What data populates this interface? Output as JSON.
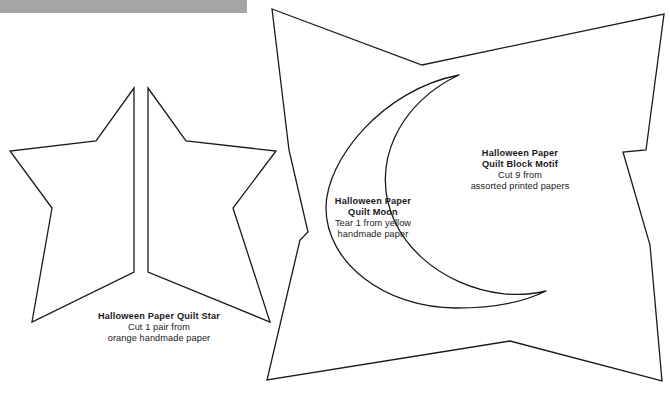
{
  "page": {
    "background_color": "#ffffff",
    "ink_color": "#1a1a1a",
    "scan_bar_color": "#a5a5a5",
    "width": 670,
    "height": 394
  },
  "templates": [
    {
      "id": "star",
      "shape": "five-pointed-star-split-in-half",
      "title": "Halloween Paper Quilt Star",
      "line1": "Cut 1 pair from",
      "line2": "orange handmade paper"
    },
    {
      "id": "moon",
      "shape": "crescent-moon",
      "title_line1": "Halloween Paper",
      "title_line2": "Quilt Moon",
      "line1": "Tear 1 from yellow",
      "line2": "handmade paper"
    },
    {
      "id": "block",
      "shape": "concave-square-quilt-block",
      "title_line1": "Halloween Paper",
      "title_line2": "Quilt Block Motif",
      "line1": "Cut 9 from",
      "line2": "assorted printed papers"
    }
  ]
}
